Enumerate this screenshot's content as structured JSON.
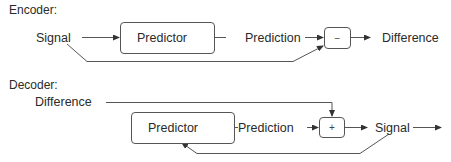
{
  "encoder": {
    "title": "Encoder:",
    "input_label": "Signal",
    "predictor_label": "Predictor",
    "prediction_label": "Prediction",
    "operator": "−",
    "output_label": "Difference"
  },
  "decoder": {
    "title": "Decoder:",
    "input_label": "Difference",
    "predictor_label": "Predictor",
    "prediction_label": "Prediction",
    "operator": "+",
    "output_label": "Signal"
  },
  "colors": {
    "line": "#444444",
    "text": "#2a2a2a",
    "background": "#ffffff"
  }
}
